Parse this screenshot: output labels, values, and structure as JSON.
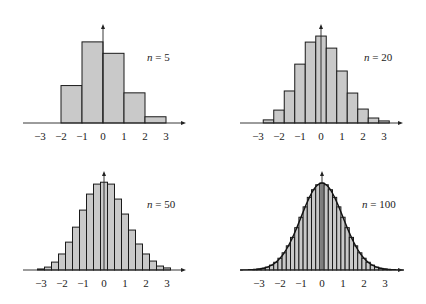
{
  "figure": {
    "bar_fill": "#c9c9c9",
    "bar_stroke": "#1a1a1a",
    "axis_color": "#222222"
  },
  "chart_data": [
    {
      "type": "bar",
      "title": "n = 5",
      "label_var": "n",
      "label_eq": " = 5",
      "xlabel": "",
      "ylabel": "",
      "xlim": [
        -3.5,
        3.7
      ],
      "x_ticks": [
        "−3",
        "−2",
        "−1",
        "0",
        "1",
        "2",
        "3"
      ],
      "x_tick_values": [
        -3,
        -2,
        -1,
        0,
        1,
        2,
        3
      ],
      "bin_width": 1.0,
      "bin_centers": [
        -1.5,
        -0.5,
        0.5,
        1.5,
        2.5
      ],
      "values": [
        0.18,
        0.39,
        0.335,
        0.145,
        0.03
      ],
      "grid": false,
      "legend": "none"
    },
    {
      "type": "bar",
      "title": "n = 20",
      "label_var": "n",
      "label_eq": " = 20",
      "xlabel": "",
      "ylabel": "",
      "xlim": [
        -3.9,
        3.9
      ],
      "x_ticks": [
        "−3",
        "−2",
        "−1",
        "0",
        "1",
        "2",
        "3"
      ],
      "x_tick_values": [
        -3,
        -2,
        -1,
        0,
        1,
        2,
        3
      ],
      "bin_width": 0.5,
      "bin_centers": [
        -2.5,
        -2.0,
        -1.5,
        -1.0,
        -0.5,
        0.0,
        0.5,
        1.0,
        1.5,
        2.0,
        2.5,
        3.0
      ],
      "values": [
        0.015,
        0.062,
        0.154,
        0.283,
        0.389,
        0.418,
        0.36,
        0.25,
        0.144,
        0.067,
        0.024,
        0.01
      ],
      "grid": false,
      "legend": "none"
    },
    {
      "type": "bar",
      "title": "n = 50",
      "label_var": "n",
      "label_eq": " = 50",
      "xlabel": "",
      "ylabel": "",
      "xlim": [
        -3.0,
        3.5
      ],
      "x_ticks": [
        "−3",
        "−2",
        "−1",
        "0",
        "1",
        "2",
        "3"
      ],
      "x_tick_values": [
        -3,
        -2,
        -1,
        0,
        1,
        2,
        3
      ],
      "bin_width": 0.3333,
      "bin_centers": [
        -3.0,
        -2.6667,
        -2.3333,
        -2.0,
        -1.6667,
        -1.3333,
        -1.0,
        -0.6667,
        -0.3333,
        0.0,
        0.3333,
        0.6667,
        1.0,
        1.3333,
        1.6667,
        2.0,
        2.3333,
        2.6667,
        3.0
      ],
      "values": [
        0.005,
        0.014,
        0.038,
        0.077,
        0.134,
        0.206,
        0.288,
        0.365,
        0.413,
        0.422,
        0.413,
        0.341,
        0.269,
        0.192,
        0.125,
        0.077,
        0.043,
        0.019,
        0.01
      ],
      "grid": false,
      "legend": "none"
    },
    {
      "type": "bar",
      "title": "n = 100",
      "label_var": "n",
      "label_eq": " = 100",
      "xlabel": "",
      "ylabel": "",
      "xlim": [
        -3.9,
        3.9
      ],
      "x_ticks": [
        "−3",
        "−2",
        "−1",
        "0",
        "1",
        "2",
        "3"
      ],
      "x_tick_values": [
        -3,
        -2,
        -1,
        0,
        1,
        2,
        3
      ],
      "bin_width": 0.2,
      "bin_centers": [
        -3.2,
        -3.0,
        -2.8,
        -2.6,
        -2.4,
        -2.2,
        -2.0,
        -1.8,
        -1.6,
        -1.4,
        -1.2,
        -1.0,
        -0.8,
        -0.6,
        -0.4,
        -0.2,
        0.0,
        0.2,
        0.4,
        0.6,
        0.8,
        1.0,
        1.2,
        1.4,
        1.6,
        1.8,
        2.0,
        2.2,
        2.4,
        2.6,
        2.8,
        3.0,
        3.2
      ],
      "values": [
        0.0024,
        0.0044,
        0.0079,
        0.0136,
        0.0224,
        0.0355,
        0.054,
        0.079,
        0.1109,
        0.1497,
        0.1942,
        0.242,
        0.2897,
        0.3332,
        0.3683,
        0.391,
        0.3989,
        0.391,
        0.3683,
        0.3332,
        0.2897,
        0.242,
        0.1942,
        0.1497,
        0.1109,
        0.079,
        0.054,
        0.0355,
        0.0224,
        0.0136,
        0.0079,
        0.0044,
        0.0024
      ],
      "overlay_curve": "standard normal density",
      "grid": false,
      "legend": "none"
    }
  ]
}
